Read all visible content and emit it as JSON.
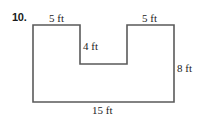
{
  "problem": {
    "number": "10."
  },
  "figure": {
    "shape": "U-shaped polygon (rectangle with rectangular notch cut from top center)",
    "stroke_color": "#5a5a5a",
    "fill_color": "#ffffff",
    "labels": {
      "top_left": "5 ft",
      "top_right": "5 ft",
      "notch_depth": "4 ft",
      "right_side": "8 ft",
      "bottom": "15 ft"
    },
    "dimensions": {
      "total_width_ft": 15,
      "total_height_ft": 8,
      "left_top_segment_ft": 5,
      "right_top_segment_ft": 5,
      "notch_depth_ft": 4
    }
  }
}
